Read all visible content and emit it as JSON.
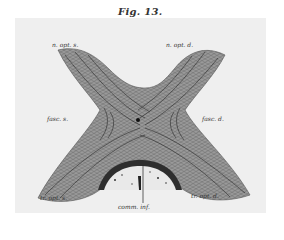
{
  "figure": {
    "title": "Fig. 13.",
    "colors": {
      "page": "#ffffff",
      "plate": "#efefef",
      "ink": "#333333",
      "fibre_dark": "#2a2a2a",
      "fibre_mid": "#6a6a6a",
      "fibre_light": "#a8a8a8"
    },
    "labels": {
      "top_left": "n. opt. s.",
      "top_right": "n. opt. d.",
      "mid_left": "fasc. s.",
      "mid_right": "fasc. d.",
      "bottom_left": "tr. opt. s.",
      "bottom_right": "tr. opt. d.",
      "bottom_center": "comm. inf."
    }
  }
}
